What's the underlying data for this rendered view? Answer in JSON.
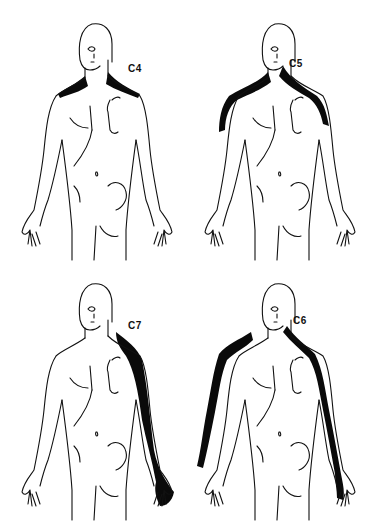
{
  "figure": {
    "type": "dermatome-diagram",
    "panels": [
      {
        "id": "c4",
        "label": "C4",
        "region": "neck and top of shoulders (bilateral)"
      },
      {
        "id": "c5",
        "label": "C5",
        "region": "neck, shoulders and lateral upper arms (bilateral)"
      },
      {
        "id": "c7",
        "label": "C7",
        "region": "posterior/lateral arm to middle finger (one side)"
      },
      {
        "id": "c6",
        "label": "C6",
        "region": "neck, shoulders, lateral arms and forearms to thumb (bilateral)"
      }
    ]
  },
  "colors": {
    "outline": "#111111",
    "shading": "#0a0a0a",
    "background": "#ffffff"
  }
}
